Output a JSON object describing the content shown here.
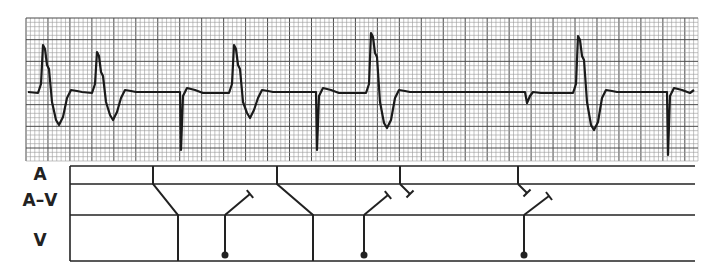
{
  "figure": {
    "type": "ECG rhythm strip with ladder (Lewis) diagram",
    "ecg_strip": {
      "grid": {
        "x": 26,
        "y": 18,
        "width": 672,
        "height": 143,
        "small_square_px": 4.4,
        "large_square_px": 22,
        "minor_color": "#9a9a9a",
        "major_color": "#4a4a4a",
        "background": "#ffffff"
      },
      "trace_color": "#1a1a1a",
      "baseline_y": 92,
      "events": [
        {
          "kind": "wide-QRS",
          "x": 42,
          "peak_y": 45,
          "trough_y": 125
        },
        {
          "kind": "wide-QRS",
          "x": 96,
          "peak_y": 52,
          "trough_y": 120
        },
        {
          "kind": "narrow-spike-down",
          "x": 181,
          "bottom_y": 150
        },
        {
          "kind": "wide-QRS",
          "x": 233,
          "peak_y": 45,
          "trough_y": 118
        },
        {
          "kind": "narrow-spike-down",
          "x": 317,
          "bottom_y": 150
        },
        {
          "kind": "wide-QRS",
          "x": 370,
          "peak_y": 33,
          "trough_y": 128
        },
        {
          "kind": "notch",
          "x": 527,
          "y": 103
        },
        {
          "kind": "wide-QRS",
          "x": 577,
          "peak_y": 36,
          "trough_y": 130
        },
        {
          "kind": "narrow-spike-down",
          "x": 668,
          "bottom_y": 155
        }
      ]
    },
    "ladder": {
      "labels": [
        {
          "id": "A",
          "text": "A",
          "y": 175
        },
        {
          "id": "AV",
          "text": "A–V",
          "y": 200
        },
        {
          "id": "V",
          "text": "V",
          "y": 240
        }
      ],
      "rows_y": [
        166,
        184,
        215,
        261
      ],
      "left_x": 70,
      "right_x": 695,
      "line_color": "#222222",
      "atrial_conducted": [
        {
          "a_x": 153,
          "v_x": 178
        },
        {
          "a_x": 277,
          "v_x": 313
        }
      ],
      "atrial_blocked": [
        {
          "a_x": 400,
          "end_x": 410,
          "end_y": 194
        },
        {
          "a_x": 518,
          "end_x": 527,
          "end_y": 193
        }
      ],
      "ventricular_ectopic": [
        {
          "x": 225,
          "end_x": 250,
          "end_y": 194
        },
        {
          "x": 364,
          "end_x": 388,
          "end_y": 195
        },
        {
          "x": 524,
          "end_x": 549,
          "end_y": 196
        }
      ]
    }
  }
}
